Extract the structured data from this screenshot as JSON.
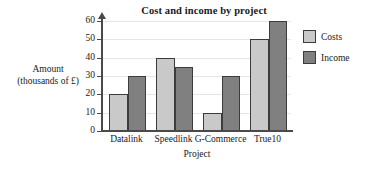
{
  "chart_data": {
    "type": "bar",
    "title": "Cost and income by project",
    "xlabel": "Project",
    "ylabel_line1": "Amount",
    "ylabel_line2": "(thousands of £)",
    "categories": [
      "Datalink",
      "Speedlink",
      "G-Commerce",
      "True10"
    ],
    "series": [
      {
        "name": "Costs",
        "values": [
          20,
          40,
          10,
          50
        ],
        "color": "#c9c9c9"
      },
      {
        "name": "Income",
        "values": [
          30,
          35,
          30,
          60
        ],
        "color": "#808080"
      }
    ],
    "ylim": [
      0,
      60
    ],
    "ytick_values": [
      0,
      10,
      20,
      30,
      40,
      50,
      60
    ],
    "ytick_labels": [
      "0",
      "10",
      "20",
      "30",
      "40",
      "50",
      "60"
    ],
    "grid": true,
    "legend_position": "right",
    "legend_entries": [
      "Costs",
      "Income"
    ]
  }
}
